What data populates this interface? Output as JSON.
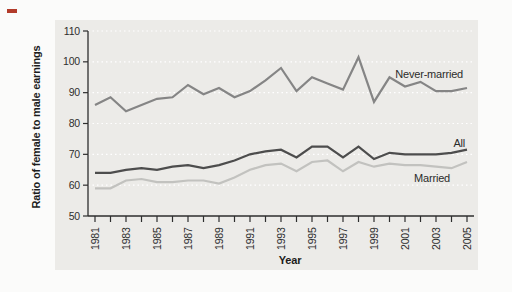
{
  "figure": {
    "x_axis_title": "Year",
    "y_axis_title": "Ratio of female to male earnings"
  },
  "chart_data": {
    "type": "line",
    "title": "",
    "xlabel": "Year",
    "ylabel": "Ratio of female to male earnings",
    "x": [
      1981,
      1982,
      1983,
      1984,
      1985,
      1986,
      1987,
      1988,
      1989,
      1990,
      1991,
      1992,
      1993,
      1994,
      1995,
      1996,
      1997,
      1998,
      1999,
      2000,
      2001,
      2002,
      2003,
      2004,
      2005
    ],
    "x_tick_labels": [
      "1981",
      "1983",
      "1985",
      "1987",
      "1989",
      "1991",
      "1993",
      "1995",
      "1997",
      "1999",
      "2001",
      "2003",
      "2005"
    ],
    "y_ticks": [
      50,
      60,
      70,
      80,
      90,
      100,
      110
    ],
    "ylim": [
      50,
      110
    ],
    "grid": "horizontal dotted white lines at 60,70,80,90,100,110",
    "legend_position": "inline labels at right of lines",
    "series": [
      {
        "name": "Never-married",
        "color": "#858585",
        "values": [
          86,
          88.5,
          84,
          86,
          88,
          88.5,
          92.5,
          89.5,
          91.5,
          88.5,
          90.5,
          94,
          98,
          90.5,
          95,
          93,
          91,
          101.5,
          87,
          95,
          92,
          93.5,
          90.5,
          90.5,
          91.5
        ]
      },
      {
        "name": "All",
        "color": "#4d4d4d",
        "values": [
          64,
          64,
          65,
          65.5,
          65,
          66,
          66.5,
          65.5,
          66.5,
          68,
          70,
          71,
          71.5,
          69,
          72.5,
          72.5,
          69,
          72.5,
          68.5,
          70.5,
          70,
          70,
          70,
          70.5,
          71.5
        ]
      },
      {
        "name": "Married",
        "color": "#c2c2bf",
        "values": [
          59,
          59,
          61.5,
          62,
          61,
          61,
          61.5,
          61.5,
          60.5,
          62.5,
          65,
          66.5,
          67,
          64.5,
          67.5,
          68,
          64.5,
          67.5,
          66,
          67,
          66.5,
          66.5,
          66,
          65.5,
          67.5
        ]
      }
    ],
    "colors": {
      "panel": "#ecebe8",
      "background": "#fbfbfa",
      "grid": "#ffffff",
      "axis": "#2e2e2e",
      "red_marker": "#b23b2a"
    }
  }
}
